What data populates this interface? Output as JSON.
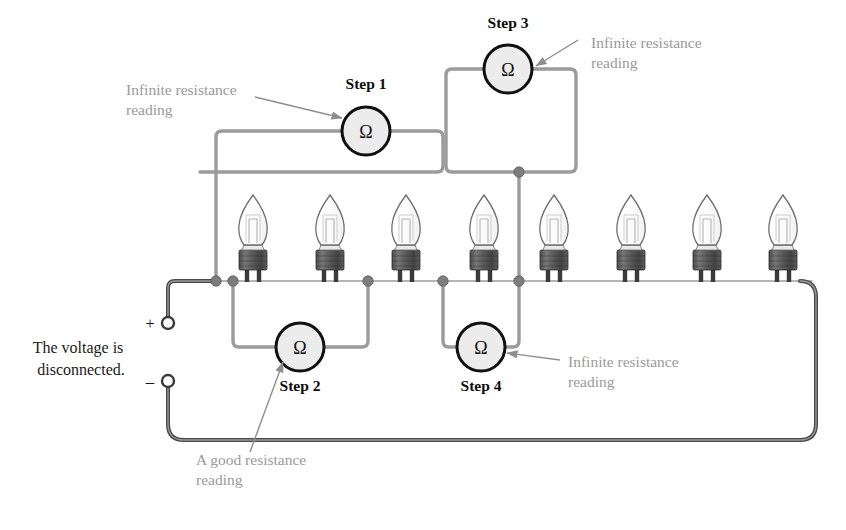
{
  "figure": {
    "background_color": "#ffffff"
  },
  "colors": {
    "probe_wire": "#9b9b9b",
    "main_wire": "#575757",
    "wire_dark": "#3c3c3c",
    "junction_dot": "#7d7d7d",
    "meter_fill": "#ececec",
    "meter_stroke": "#111111",
    "bulb_base": "#5d5d5d",
    "bulb_glass_stroke": "#6e6e6e",
    "callout_gray": "#9a9a9a",
    "label_black": "#0c0c0c",
    "note_black": "#1a1a1a"
  },
  "notes": {
    "voltage_note_line1": "The voltage is",
    "voltage_note_line2": "disconnected.",
    "plus_sign": "+",
    "minus_sign": "–"
  },
  "meter_symbol": "Ω",
  "meters": [
    {
      "id": "step-1",
      "step_label": "Step 1",
      "symbol": "Ω",
      "cx": 366,
      "cy": 131,
      "r": 24,
      "label_x": 366,
      "label_y": 89,
      "reading": "Infinite resistance reading"
    },
    {
      "id": "step-3",
      "step_label": "Step 3",
      "symbol": "Ω",
      "cx": 508,
      "cy": 69,
      "r": 24,
      "label_x": 508,
      "label_y": 28,
      "reading": "Infinite resistance reading"
    },
    {
      "id": "step-2",
      "step_label": "Step 2",
      "symbol": "Ω",
      "cx": 300,
      "cy": 347,
      "r": 24,
      "label_x": 300,
      "label_y": 391,
      "reading": "A good resistance reading"
    },
    {
      "id": "step-4",
      "step_label": "Step 4",
      "symbol": "Ω",
      "cx": 481,
      "cy": 347,
      "r": 24,
      "label_x": 481,
      "label_y": 391,
      "reading": "Infinite resistance reading"
    }
  ],
  "callouts": [
    {
      "id": "callout-step1",
      "line1": "Infinite resistance",
      "line2": "reading",
      "text_x": 126,
      "line1_y": 95,
      "line2_y": 115,
      "arrow": {
        "x1": 255,
        "y1": 97,
        "x2": 342,
        "y2": 118
      }
    },
    {
      "id": "callout-step3",
      "line1": "Infinite resistance",
      "line2": "reading",
      "text_x": 591,
      "line1_y": 48,
      "line2_y": 68,
      "arrow": {
        "x1": 578,
        "y1": 40,
        "x2": 536,
        "y2": 66
      }
    },
    {
      "id": "callout-step2",
      "line1": "A good resistance",
      "line2": "reading",
      "text_x": 196,
      "line1_y": 465,
      "line2_y": 485,
      "arrow": {
        "x1": 250,
        "y1": 452,
        "x2": 283,
        "y2": 362
      }
    },
    {
      "id": "callout-step4",
      "line1": "Infinite resistance",
      "line2": "reading",
      "text_x": 568,
      "line1_y": 367,
      "line2_y": 387,
      "arrow": {
        "x1": 560,
        "y1": 360,
        "x2": 507,
        "y2": 353
      }
    }
  ],
  "bulbs": [
    {
      "id": "bulb-1",
      "x": 253
    },
    {
      "id": "bulb-2",
      "x": 330
    },
    {
      "id": "bulb-3",
      "x": 406
    },
    {
      "id": "bulb-4",
      "x": 484
    },
    {
      "id": "bulb-5",
      "x": 554
    },
    {
      "id": "bulb-6",
      "x": 631
    },
    {
      "id": "bulb-7",
      "x": 707
    },
    {
      "id": "bulb-8",
      "x": 783
    }
  ],
  "bus": {
    "y": 281,
    "x_start": 152,
    "x_end": 816
  },
  "junctions": [
    {
      "id": "junction-a",
      "x": 216,
      "y": 281
    },
    {
      "id": "junction-b",
      "x": 233,
      "y": 281
    },
    {
      "id": "junction-c",
      "x": 368,
      "y": 281
    },
    {
      "id": "junction-d",
      "x": 443,
      "y": 281
    },
    {
      "id": "junction-e",
      "x": 519,
      "y": 281
    },
    {
      "id": "junction-f",
      "x": 519,
      "y": 172
    }
  ],
  "terminals": [
    {
      "id": "terminal-positive",
      "sign": "+",
      "cx": 168,
      "cy": 323,
      "sign_x": 150,
      "sign_y": 329
    },
    {
      "id": "terminal-negative",
      "sign": "–",
      "cx": 168,
      "cy": 381,
      "sign_x": 150,
      "sign_y": 387
    }
  ]
}
